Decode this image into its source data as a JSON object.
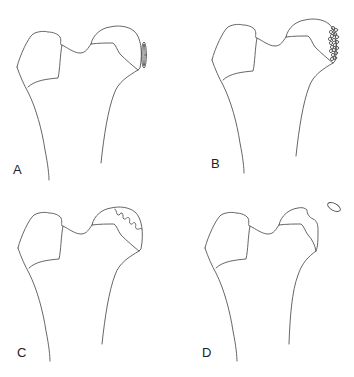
{
  "figure": {
    "line_color": "#555555",
    "panels": [
      {
        "id": "A",
        "label": "A",
        "lesion": "thin-elliptical-fragment-at-head-edge"
      },
      {
        "id": "B",
        "label": "B",
        "lesion": "cluster-of-small-circles-at-head-edge"
      },
      {
        "id": "C",
        "label": "C",
        "lesion": "serrated-zigzag-line-within-head"
      },
      {
        "id": "D",
        "label": "D",
        "lesion": "detached-ellipse-above-head"
      }
    ]
  }
}
